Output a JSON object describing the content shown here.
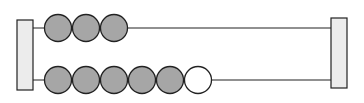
{
  "diagram": {
    "type": "abacus-bead-model",
    "colors": {
      "post_fill": "#ececec",
      "stroke": "#222222",
      "filled_bead": "#a6a6a6",
      "empty_bead": "#ffffff"
    },
    "rods": [
      {
        "name": "top-rod",
        "filled_beads": 3,
        "empty_beads": 0
      },
      {
        "name": "bottom-rod",
        "filled_beads": 5,
        "empty_beads": 1
      }
    ]
  }
}
